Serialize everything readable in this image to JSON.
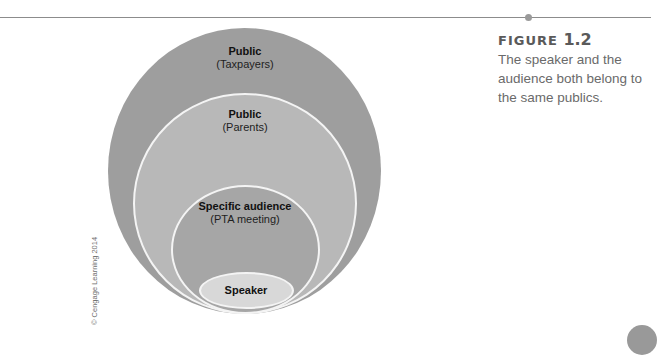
{
  "figure": {
    "label_prefix": "FIGURE",
    "label_number": "1.2",
    "caption": "The speaker and the audience both belong to the same publics."
  },
  "diagram": {
    "rings": [
      {
        "title": "Public",
        "subtitle": "(Taxpayers)",
        "color": "#9e9e9e"
      },
      {
        "title": "Public",
        "subtitle": "(Parents)",
        "color": "#b8b8b8"
      },
      {
        "title": "Specific audience",
        "subtitle": "(PTA meeting)",
        "color": "#a6a6a6"
      },
      {
        "title": "Speaker",
        "subtitle": "",
        "color": "#d8d8d8"
      }
    ]
  },
  "credit": "© Cengage Learning 2014"
}
